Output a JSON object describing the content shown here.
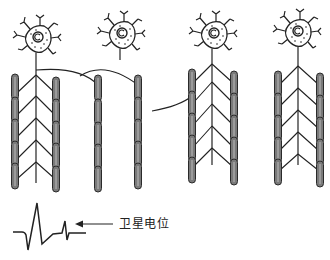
{
  "diagram": {
    "type": "motor-unit-reinnervation-schematic",
    "label": "卫星电位",
    "colors": {
      "line": "#222222",
      "fiber_fill": "#7a7a7a",
      "fiber_outline": "#2a2a2a",
      "background": "#ffffff"
    },
    "motor_units": [
      {
        "id": 1,
        "neuron_x": 38,
        "neuron_y": 38,
        "axon": true,
        "left_fiber_x": 16,
        "right_fiber_x": 56,
        "fibers_per_side": 5
      },
      {
        "id": 2,
        "neuron_x": 122,
        "neuron_y": 32,
        "axon": false,
        "left_fiber_x": 98,
        "right_fiber_x": 138,
        "fibers_per_side": 5
      },
      {
        "id": 3,
        "neuron_x": 214,
        "neuron_y": 32,
        "axon": true,
        "left_fiber_x": 192,
        "right_fiber_x": 234,
        "fibers_per_side": 5
      },
      {
        "id": 4,
        "neuron_x": 298,
        "neuron_y": 30,
        "axon": true,
        "left_fiber_x": 278,
        "right_fiber_x": 320,
        "fibers_per_side": 5
      }
    ],
    "waveform": {
      "description": "motor unit potential followed by late satellite potential",
      "arrow_points_to": "satellite-potential"
    }
  }
}
